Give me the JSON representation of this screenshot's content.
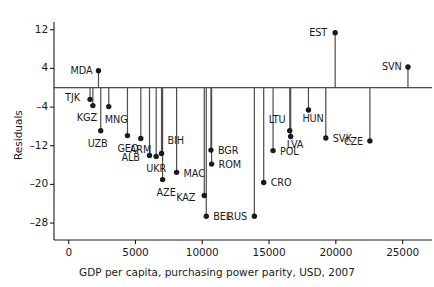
{
  "chart_data": {
    "type": "scatter",
    "title": "",
    "xlabel": "GDP per capita, purchasing power parity, USD, 2007",
    "ylabel": "Residuals",
    "xlim": [
      -1100,
      27200
    ],
    "ylim": [
      -31.5,
      13.6
    ],
    "grid": false,
    "legend": "none",
    "xticks": [
      "0",
      "5000",
      "10000",
      "15000",
      "20000",
      "25000"
    ],
    "xtick_values": [
      0,
      5000,
      10000,
      15000,
      20000,
      25000
    ],
    "yticks": [
      "12",
      "4",
      "–4",
      "–12",
      "–20",
      "–28"
    ],
    "ytick_values": [
      12,
      4,
      -4,
      -12,
      -20,
      -28
    ],
    "zero_line": 0,
    "marker": "filled-circle",
    "marker_color": "#1a1a1a",
    "stem_color": "#4d4d4d",
    "axis_color": "#1a1a1a",
    "points": [
      {
        "label": "TJK",
        "x": 1600,
        "y": -2.4,
        "lx": -25,
        "ly": -1
      },
      {
        "label": "MDA",
        "x": 2230,
        "y": 3.5,
        "lx": -28,
        "ly": 0
      },
      {
        "label": "KGZ",
        "x": 1810,
        "y": -3.7,
        "lx": -16,
        "ly": 12
      },
      {
        "label": "UZB",
        "x": 2400,
        "y": -8.9,
        "lx": -13,
        "ly": 13
      },
      {
        "label": "MNG",
        "x": 3000,
        "y": -3.9,
        "lx": -4,
        "ly": 13
      },
      {
        "label": "GEO",
        "x": 4400,
        "y": -9.9,
        "lx": -10,
        "ly": 13
      },
      {
        "label": "ARM",
        "x": 5400,
        "y": -10.5,
        "lx": -11,
        "ly": 12
      },
      {
        "label": "ALB",
        "x": 6050,
        "y": -14.0,
        "lx": -28,
        "ly": 3
      },
      {
        "label": "UKR",
        "x": 6550,
        "y": -14.2,
        "lx": -10,
        "ly": 13
      },
      {
        "label": "BIH",
        "x": 6950,
        "y": -13.6,
        "lx": 6,
        "ly": -12
      },
      {
        "label": "AZE",
        "x": 7030,
        "y": -19.0,
        "lx": -6,
        "ly": 13
      },
      {
        "label": "MAC",
        "x": 8080,
        "y": -17.5,
        "lx": 7,
        "ly": 2
      },
      {
        "label": "KAZ",
        "x": 10150,
        "y": -22.3,
        "lx": -28,
        "ly": 2
      },
      {
        "label": "BEL",
        "x": 10300,
        "y": -26.6,
        "lx": 7,
        "ly": 1
      },
      {
        "label": "BGR",
        "x": 10650,
        "y": -12.9,
        "lx": 7,
        "ly": 1
      },
      {
        "label": "ROM",
        "x": 10700,
        "y": -15.8,
        "lx": 7,
        "ly": 1
      },
      {
        "label": "RUS",
        "x": 13900,
        "y": -26.6,
        "lx": -27,
        "ly": 1
      },
      {
        "label": "CRO",
        "x": 14600,
        "y": -19.6,
        "lx": 7,
        "ly": 1
      },
      {
        "label": "POL",
        "x": 15300,
        "y": -13.0,
        "lx": 7,
        "ly": 1
      },
      {
        "label": "LTU",
        "x": 16550,
        "y": -8.9,
        "lx": -21,
        "ly": -11
      },
      {
        "label": "LVA",
        "x": 16620,
        "y": -10.1,
        "lx": -4,
        "ly": 8
      },
      {
        "label": "HUN",
        "x": 17950,
        "y": -4.6,
        "lx": -6,
        "ly": 9
      },
      {
        "label": "EST",
        "x": 19950,
        "y": 11.4,
        "lx": -26,
        "ly": 0
      },
      {
        "label": "SVK",
        "x": 19250,
        "y": -10.4,
        "lx": 7,
        "ly": 1
      },
      {
        "label": "CZE",
        "x": 22550,
        "y": -11.0,
        "lx": -26,
        "ly": 1
      },
      {
        "label": "SVN",
        "x": 25400,
        "y": 4.3,
        "lx": -26,
        "ly": 0
      }
    ]
  }
}
